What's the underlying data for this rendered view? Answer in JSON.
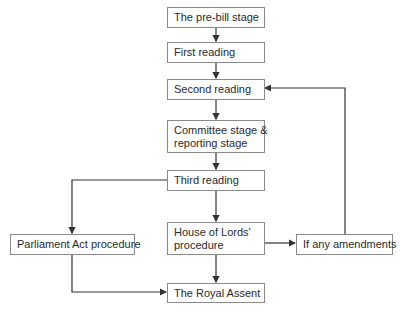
{
  "diagram": {
    "type": "flowchart",
    "nodes": {
      "pre_bill": "The pre-bill stage",
      "first_reading": "First reading",
      "second_reading": "Second reading",
      "committee_line1": "Committee stage &",
      "committee_line2": "reporting stage",
      "third_reading": "Third reading",
      "lords_line1": "House of Lords'",
      "lords_line2": "procedure",
      "parliament_act": "Parliament Act procedure",
      "amendments": "If any amendments",
      "royal_assent": "The Royal Assent"
    },
    "edges": [
      {
        "from": "The pre-bill stage",
        "to": "First reading"
      },
      {
        "from": "First reading",
        "to": "Second reading"
      },
      {
        "from": "Second reading",
        "to": "Committee stage & reporting stage"
      },
      {
        "from": "Committee stage & reporting stage",
        "to": "Third reading"
      },
      {
        "from": "Third reading",
        "to": "House of Lords' procedure"
      },
      {
        "from": "Third reading",
        "to": "Parliament Act procedure"
      },
      {
        "from": "House of Lords' procedure",
        "to": "The Royal Assent"
      },
      {
        "from": "House of Lords' procedure",
        "to": "If any amendments"
      },
      {
        "from": "If any amendments",
        "to": "Second reading"
      },
      {
        "from": "Parliament Act procedure",
        "to": "The Royal Assent"
      }
    ],
    "colors": {
      "line": "#333333",
      "border": "#8a8a8a",
      "text": "#2a2a2a"
    }
  }
}
